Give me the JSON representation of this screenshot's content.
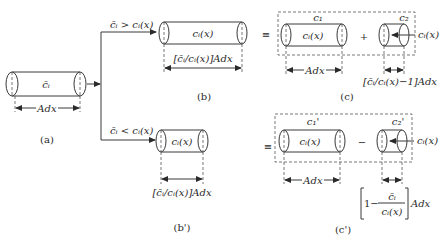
{
  "diagram": {
    "panel_a": {
      "label": "(a)",
      "cylinder_label": "c̄ᵢ",
      "width_label": "Adx"
    },
    "branch_upper": {
      "condition": "c̄ᵢ > cᵢ(x)"
    },
    "branch_lower": {
      "condition": "c̄ᵢ < cᵢ(x)"
    },
    "panel_b": {
      "label": "(b)",
      "cylinder_label": "cᵢ(x)",
      "width_label": "[c̄ᵢ/cᵢ(x)]Adx"
    },
    "panel_b_prime": {
      "label": "(b')",
      "cylinder_label": "cᵢ(x)",
      "width_label": "[c̄ᵢ/cᵢ(x)]Adx"
    },
    "equiv_symbol": "≡",
    "panel_c": {
      "label": "(c)",
      "part1_name": "c₁",
      "part1_cylinder_label": "cᵢ(x)",
      "part1_width_label": "Adx",
      "operator": "+",
      "part2_name": "c₂",
      "part2_arrow_label": "cᵢ(x)",
      "part2_width_label": "[c̄ᵢ/cᵢ(x)−1]Adx"
    },
    "panel_c_prime": {
      "label": "(c')",
      "part1_name": "c₁'",
      "part1_cylinder_label": "cᵢ(x)",
      "part1_width_label": "Adx",
      "operator": "−",
      "part2_name": "c₂'",
      "part2_arrow_label": "cᵢ(x)",
      "part2_width_label": {
        "bracket_left": "1−",
        "numerator": "c̄ᵢ",
        "denominator": "cᵢ(x)",
        "suffix": "Adx"
      }
    },
    "colors": {
      "stroke": "#3a3a3a",
      "text": "#2a2a2a",
      "background": "#ffffff"
    }
  }
}
